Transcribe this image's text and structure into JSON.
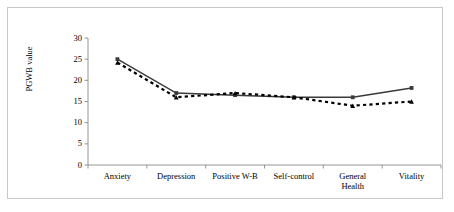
{
  "figure": {
    "border_color": "#c8c8c8",
    "background": "#ffffff"
  },
  "chart_data": {
    "type": "line",
    "title": "",
    "xlabel": "",
    "ylabel": "PGWB value",
    "ylim": [
      0,
      30
    ],
    "yticks": [
      0,
      5,
      10,
      15,
      20,
      25,
      30
    ],
    "ytick_labels": [
      "0",
      "5",
      "10",
      "15",
      "20",
      "25",
      "30"
    ],
    "grid": false,
    "legend": "none",
    "categories": [
      "Anxiety",
      "Depression",
      "Positive W-B",
      "Self-control",
      "General Health",
      "Vitality"
    ],
    "category_lines": [
      [
        "Anxiety"
      ],
      [
        "Depression"
      ],
      [
        "Positive W-B"
      ],
      [
        "Self-control"
      ],
      [
        "General",
        "Health"
      ],
      [
        "Vitality"
      ]
    ],
    "series": [
      {
        "name": "series-solid",
        "style": "solid",
        "marker": "square",
        "color": "#3a3a3a",
        "values": [
          25.0,
          17.0,
          16.5,
          16.0,
          16.0,
          18.2
        ]
      },
      {
        "name": "series-dashed",
        "style": "dashed",
        "marker": "triangle",
        "color": "#000000",
        "values": [
          24.2,
          16.0,
          17.0,
          16.0,
          14.0,
          15.0
        ]
      }
    ]
  }
}
